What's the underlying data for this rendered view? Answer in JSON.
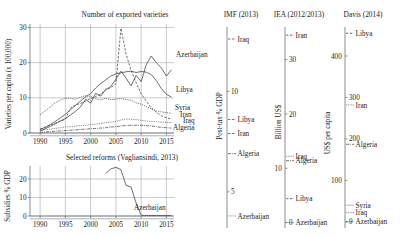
{
  "figure": {
    "width": 403,
    "height": 237,
    "background": "#ffffff",
    "ink": "#1a1a1a",
    "grid_color": "#9aa0a6"
  },
  "panel_titles": {
    "main": "Number of exported varieties",
    "imf": "IMF (2013)",
    "iea": "IEA (2012/2013)",
    "davis": "Davis (2014)",
    "subsidies": "Selected reforms (Vagliansindi, 2013)"
  },
  "chart_data": [
    {
      "id": "main",
      "type": "line",
      "title": "Number of exported varieties",
      "xlabel": "",
      "ylabel": "Varieties per capita (x 100,000)",
      "xlim": [
        1988,
        2016.5
      ],
      "ylim": [
        0,
        31
      ],
      "xticks": [
        1990,
        1995,
        2000,
        2005,
        2010,
        2015
      ],
      "xticklabels": [
        "1990",
        "1995",
        "2000",
        "2005",
        "2010",
        "2015"
      ],
      "yticks": [
        0,
        10,
        20,
        30
      ],
      "yticklabels": [
        "0",
        "10",
        "20",
        "30"
      ],
      "grid": true,
      "legend_position": "inline-right",
      "x": [
        1990,
        1991,
        1992,
        1993,
        1994,
        1995,
        1996,
        1997,
        1998,
        1999,
        2000,
        2001,
        2002,
        2003,
        2004,
        2005,
        2006,
        2007,
        2008,
        2009,
        2010,
        2011,
        2012,
        2013,
        2014,
        2015,
        2016
      ],
      "series": [
        {
          "name": "Azerbaijan",
          "style": "solid",
          "label_y_value": 20.5,
          "values": [
            0.6,
            1.2,
            1.9,
            2.6,
            3.4,
            4.1,
            5.1,
            6.2,
            7.4,
            9.6,
            8.5,
            11.3,
            10.5,
            12.4,
            13.2,
            15.3,
            17.6,
            15.6,
            13.4,
            16.4,
            14.6,
            19.4,
            21.9,
            20.0,
            18.5,
            16.2,
            18.0
          ]
        },
        {
          "name": "Libya",
          "style": "solid-light",
          "label_y_value": 10.2,
          "values": [
            1.0,
            1.6,
            2.4,
            3.3,
            4.3,
            5.3,
            6.6,
            7.8,
            9.1,
            10.3,
            11.2,
            12.8,
            14.1,
            15.1,
            16.2,
            16.8,
            17.1,
            17.4,
            17.6,
            17.2,
            17.5,
            17.3,
            16.6,
            14.9,
            12.6,
            11.0,
            10.2
          ]
        },
        {
          "name": "Syria",
          "style": "dotted",
          "label_y_value": 5.6,
          "values": [
            5.2,
            6.3,
            7.4,
            8.6,
            9.4,
            9.9,
            9.9,
            9.6,
            10.2,
            10.6,
            10.4,
            9.8,
            9.4,
            9.9,
            9.5,
            9.6,
            9.8,
            9.5,
            9.3,
            8.6,
            8.2,
            7.5,
            6.9,
            6.3,
            6.0,
            5.8,
            5.6
          ]
        },
        {
          "name": "Iran",
          "style": "dashed-spike",
          "label_y_value": 4.0,
          "values": [
            1.1,
            1.6,
            2.2,
            2.8,
            3.4,
            3.9,
            7.1,
            8.0,
            8.4,
            9.1,
            9.8,
            10.4,
            11.0,
            12.3,
            12.9,
            14.0,
            29.8,
            22.5,
            17.8,
            14.3,
            11.2,
            9.1,
            7.1,
            5.9,
            4.9,
            4.3,
            4.0
          ]
        },
        {
          "name": "Iraq",
          "style": "fine-dotted",
          "label_y_value": 3.0,
          "values": [
            0.7,
            0.9,
            1.1,
            1.3,
            1.5,
            1.7,
            1.8,
            2.0,
            2.1,
            2.2,
            2.4,
            2.5,
            2.7,
            2.9,
            3.1,
            3.3,
            3.7,
            4.0,
            3.9,
            3.8,
            3.6,
            3.4,
            3.3,
            3.2,
            3.1,
            3.0,
            3.0
          ]
        },
        {
          "name": "Algeria",
          "style": "dash-dot",
          "label_y_value": 1.4,
          "values": [
            0.2,
            0.3,
            0.4,
            0.5,
            0.6,
            0.7,
            0.8,
            0.9,
            1.0,
            1.1,
            1.2,
            1.3,
            1.4,
            1.5,
            1.7,
            1.8,
            2.0,
            2.1,
            2.2,
            2.2,
            2.2,
            2.1,
            2.0,
            1.8,
            1.6,
            1.5,
            1.4
          ]
        }
      ]
    },
    {
      "id": "imf",
      "type": "scatter-axis",
      "title": "IMF (2013)",
      "ylabel": "Post-tax % GDP",
      "ylim": [
        3.2,
        13.2
      ],
      "yticks": [
        5,
        10
      ],
      "yticklabels": [
        "5",
        "10"
      ],
      "markers": [
        {
          "name": "Iraq",
          "value": 12.6,
          "style": "dashed"
        },
        {
          "name": "Libya",
          "value": 8.6,
          "style": "dashed"
        },
        {
          "name": "Iran",
          "value": 7.9,
          "style": "dashed"
        },
        {
          "name": "Algeria",
          "value": 6.9,
          "style": "dash-dot"
        },
        {
          "name": "Azerbaijan",
          "value": 3.8,
          "style": "fine-dotted"
        }
      ]
    },
    {
      "id": "iea",
      "type": "scatter-axis",
      "title": "IEA (2012/2013)",
      "ylabel": "Billion US$",
      "ylim": [
        -1.0,
        36.0
      ],
      "yticks": [
        0,
        10,
        20,
        30
      ],
      "yticklabels": [
        "0",
        "10",
        "20",
        "30"
      ],
      "markers": [
        {
          "name": "Iran",
          "value": 34.5,
          "style": "dashed"
        },
        {
          "name": "Iraq",
          "value": 12.2,
          "style": "fine-dotted"
        },
        {
          "name": "Algeria",
          "value": 11.4,
          "style": "dash-dot"
        },
        {
          "name": "Libya",
          "value": 4.4,
          "style": "dashed"
        },
        {
          "name": "Azerbaijan",
          "value": 0.0,
          "style": "fine-dotted"
        }
      ]
    },
    {
      "id": "davis",
      "type": "scatter-axis",
      "title": "Davis (2014)",
      "ylabel": "US$ per capita",
      "ylim": [
        -15,
        470
      ],
      "yticks": [
        0,
        100,
        200,
        300,
        400
      ],
      "yticklabels": [
        "0",
        "100",
        "200",
        "300",
        "400"
      ],
      "markers": [
        {
          "name": "Libya",
          "value": 455,
          "style": "dashed"
        },
        {
          "name": "Iran",
          "value": 282,
          "style": "fine-dotted"
        },
        {
          "name": "Algeria",
          "value": 187,
          "style": "dash-dot"
        },
        {
          "name": "Syria",
          "value": 40,
          "style": "solid-light"
        },
        {
          "name": "Iraq",
          "value": 22,
          "style": "fine-dotted"
        },
        {
          "name": "Azerbaijan",
          "value": 0,
          "style": "dashed"
        }
      ]
    },
    {
      "id": "subsidies",
      "type": "line",
      "title": "Selected reforms (Vagliansindi, 2013)",
      "ylabel": "Subsidies % GDP",
      "xlim": [
        1988,
        2016.5
      ],
      "ylim": [
        0,
        27
      ],
      "xticks": [
        1990,
        1995,
        2000,
        2005,
        2010,
        2015
      ],
      "xticklabels": [
        "1990",
        "1995",
        "2000",
        "2005",
        "2010",
        "2015"
      ],
      "yticks": [
        0,
        10,
        20
      ],
      "yticklabels": [
        "0",
        "10",
        "20"
      ],
      "grid": true,
      "x": [
        2003,
        2004,
        2005,
        2006,
        2007,
        2008,
        2009,
        2010,
        2011,
        2012,
        2013,
        2014,
        2015,
        2016
      ],
      "series": [
        {
          "name": "Azerbaijan",
          "style": "solid",
          "label_y_value": 1.4,
          "values": [
            23.0,
            25.4,
            26.3,
            25.0,
            16.6,
            15.6,
            7.0,
            0.4,
            0.3,
            0.3,
            0.3,
            0.3,
            0.3,
            0.3
          ]
        }
      ]
    }
  ]
}
